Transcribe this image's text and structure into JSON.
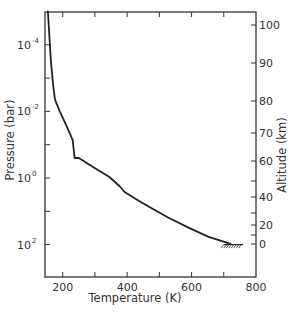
{
  "chart_data": {
    "type": "line",
    "title": "",
    "xlabel": "Temperature (K)",
    "ylabel": "Pressure (bar)",
    "y2label": "Altitude (km)",
    "xlim": [
      145,
      800
    ],
    "ylim_log10_pressure": [
      -5,
      3
    ],
    "y2lim": [
      -10,
      104
    ],
    "x_ticks": [
      {
        "value": 200,
        "label": "200"
      },
      {
        "value": 300,
        "label": ""
      },
      {
        "value": 400,
        "label": "400"
      },
      {
        "value": 500,
        "label": ""
      },
      {
        "value": 600,
        "label": "600"
      },
      {
        "value": 700,
        "label": ""
      },
      {
        "value": 800,
        "label": "800"
      }
    ],
    "y_ticks": [
      {
        "log10": -4,
        "label_base": "10",
        "label_exp": "-4"
      },
      {
        "log10": -3,
        "label_base": "",
        "label_exp": ""
      },
      {
        "log10": -2,
        "label_base": "10",
        "label_exp": "-2"
      },
      {
        "log10": -1,
        "label_base": "",
        "label_exp": ""
      },
      {
        "log10": 0,
        "label_base": "10",
        "label_exp": "0"
      },
      {
        "log10": 1,
        "label_base": "",
        "label_exp": ""
      },
      {
        "log10": 2,
        "label_base": "10",
        "label_exp": "2"
      }
    ],
    "y2_ticks": [
      {
        "value": 100,
        "label": "100",
        "y": 25
      },
      {
        "value": 90,
        "label": "90",
        "y": 63
      },
      {
        "value": 80,
        "label": "80",
        "y": 101
      },
      {
        "value": 70,
        "label": "70",
        "y": 133
      },
      {
        "value": 60,
        "label": "60",
        "y": 161
      },
      {
        "value": 50,
        "label": "",
        "y": 181
      },
      {
        "value": 40,
        "label": "40",
        "y": 197
      },
      {
        "value": 30,
        "label": "",
        "y": 213
      },
      {
        "value": 20,
        "label": "20",
        "y": 225
      },
      {
        "value": 10,
        "label": "",
        "y": 235
      },
      {
        "value": 0,
        "label": "0",
        "y": 244
      }
    ],
    "series": [
      {
        "name": "Temperature profile",
        "x_temperature_K": [
          154,
          163,
          170,
          176,
          191,
          210,
          231,
          237,
          250,
          284,
          345,
          376,
          392,
          432,
          469,
          530,
          592,
          653,
          721
        ],
        "y_log10_pressure_bar": [
          -5.0,
          -3.55,
          -2.8,
          -2.35,
          -2.0,
          -1.6,
          -1.14,
          -0.6,
          -0.6,
          -0.39,
          -0.03,
          0.24,
          0.42,
          0.66,
          0.87,
          1.2,
          1.5,
          1.77,
          1.98
        ]
      }
    ],
    "annotations": [
      {
        "type": "surface-hatch",
        "x_temperature_K": [
          700,
          760
        ],
        "y_log10_pressure_bar": 2.0
      }
    ],
    "grid": false,
    "legend": null
  }
}
